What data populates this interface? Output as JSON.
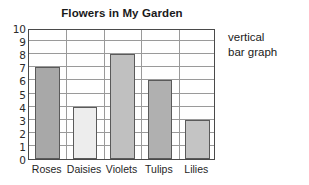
{
  "chart_data": {
    "type": "bar",
    "title": "Flowers in My Garden",
    "xlabel": "",
    "ylabel": "",
    "categories": [
      "Roses",
      "Daisies",
      "Violets",
      "Tulips",
      "Lilies"
    ],
    "values": [
      7,
      4,
      8,
      6,
      3
    ],
    "ylim": [
      0,
      10
    ],
    "y_ticks": [
      "0",
      "1",
      "2",
      "3",
      "4",
      "5",
      "6",
      "7",
      "8",
      "9",
      "10"
    ],
    "grid": true,
    "legend": null,
    "bar_colors": [
      "#a8a8a8",
      "#ededed",
      "#c0c0c0",
      "#b0b0b0",
      "#c4c4c4"
    ],
    "bar_border_color": "#5a5a5a",
    "axis_color": "#4a4a4a",
    "grid_color": "#9a9a9a",
    "annotations": [
      "vertical",
      "bar graph"
    ]
  },
  "annotation": {
    "line1": "vertical",
    "line2": "bar graph"
  }
}
